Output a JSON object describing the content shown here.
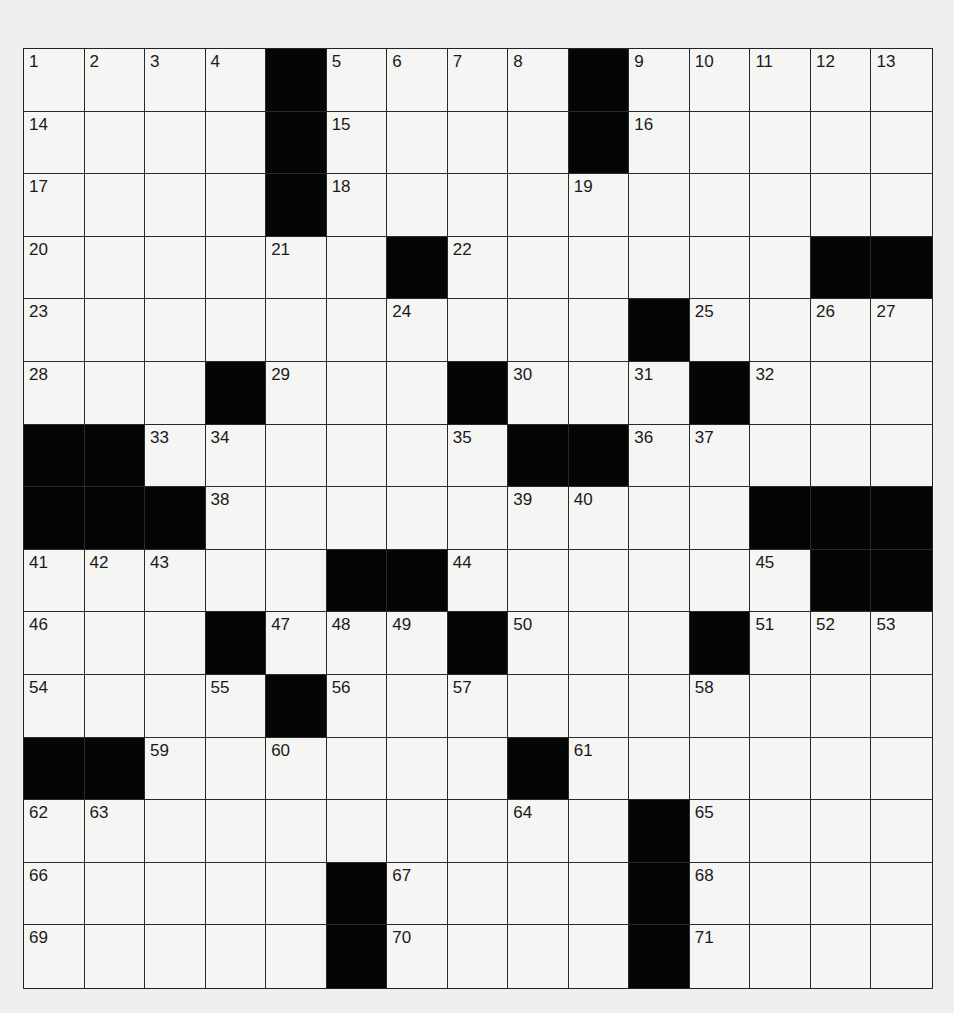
{
  "puzzle": {
    "rows": 15,
    "cols": 15,
    "colors": {
      "background": "#efefef",
      "cell": "#f5f5f4",
      "block": "#050505",
      "line": "#2a2a2a"
    },
    "layout": [
      "....#....#.....",
      "....#....#.....",
      "....#..........",
      "......#......##",
      "..........#....",
      "...#...#...#...",
      "##......##.....",
      "###.........###",
      ".....##......##",
      "...#...#...#...",
      "....#..........",
      "##......#......",
      "..........#....",
      ".....#....#....",
      ".....#....#...."
    ],
    "numbers": [
      [
        1,
        2,
        3,
        4,
        null,
        5,
        6,
        7,
        8,
        null,
        9,
        10,
        11,
        12,
        13
      ],
      [
        14,
        null,
        null,
        null,
        null,
        15,
        null,
        null,
        null,
        null,
        16,
        null,
        null,
        null,
        null
      ],
      [
        17,
        null,
        null,
        null,
        null,
        18,
        null,
        null,
        null,
        19,
        null,
        null,
        null,
        null,
        null
      ],
      [
        20,
        null,
        null,
        null,
        21,
        null,
        null,
        22,
        null,
        null,
        null,
        null,
        null,
        null,
        null
      ],
      [
        23,
        null,
        null,
        null,
        null,
        null,
        24,
        null,
        null,
        null,
        null,
        25,
        null,
        26,
        27
      ],
      [
        28,
        null,
        null,
        null,
        29,
        null,
        null,
        null,
        30,
        null,
        31,
        null,
        32,
        null,
        null
      ],
      [
        null,
        null,
        33,
        34,
        null,
        null,
        null,
        35,
        null,
        null,
        36,
        37,
        null,
        null,
        null
      ],
      [
        null,
        null,
        null,
        38,
        null,
        null,
        null,
        null,
        39,
        40,
        null,
        null,
        null,
        null,
        null
      ],
      [
        41,
        42,
        43,
        null,
        null,
        null,
        null,
        44,
        null,
        null,
        null,
        null,
        45,
        null,
        null
      ],
      [
        46,
        null,
        null,
        null,
        47,
        48,
        49,
        null,
        50,
        null,
        null,
        null,
        51,
        52,
        53
      ],
      [
        54,
        null,
        null,
        55,
        null,
        56,
        null,
        57,
        null,
        null,
        null,
        58,
        null,
        null,
        null
      ],
      [
        null,
        null,
        59,
        null,
        60,
        null,
        null,
        null,
        null,
        61,
        null,
        null,
        null,
        null,
        null
      ],
      [
        62,
        63,
        null,
        null,
        null,
        null,
        null,
        null,
        64,
        null,
        null,
        65,
        null,
        null,
        null
      ],
      [
        66,
        null,
        null,
        null,
        null,
        null,
        67,
        null,
        null,
        null,
        null,
        68,
        null,
        null,
        null
      ],
      [
        69,
        null,
        null,
        null,
        null,
        null,
        70,
        null,
        null,
        null,
        null,
        71,
        null,
        null,
        null
      ]
    ],
    "letters": []
  }
}
